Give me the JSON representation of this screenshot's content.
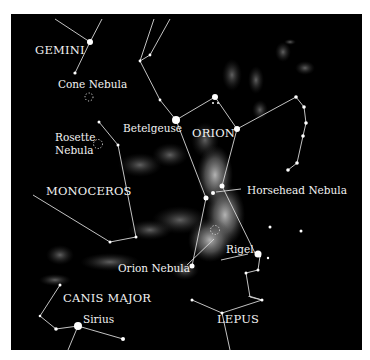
{
  "map": {
    "background": "#000000",
    "constellations": [
      {
        "label": "GEMINI"
      },
      {
        "label": "ORION"
      },
      {
        "label": "MONOCEROS"
      },
      {
        "label": "CANIS MAJOR"
      },
      {
        "label": "LEPUS"
      }
    ],
    "stars": [
      {
        "label": "Betelgeuse"
      },
      {
        "label": "Rigel"
      },
      {
        "label": "Sirius"
      }
    ],
    "nebulae": [
      {
        "label": "Cone Nebula"
      },
      {
        "label": "Rosette Nebula",
        "line1": "Rosette",
        "line2": "Nebula"
      },
      {
        "label": "Horsehead Nebula"
      },
      {
        "label": "Orion Nebula"
      }
    ],
    "colors": {
      "sky": "#000000",
      "lines": "#d8d8d8",
      "text": "#f2f2f2",
      "nebula_glow": "#8a8a8a"
    }
  }
}
